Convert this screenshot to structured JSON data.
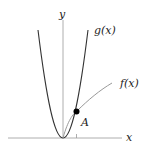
{
  "diagram": {
    "axes": {
      "x_label": "x",
      "y_label": "y"
    },
    "curves": [
      {
        "name": "g",
        "label": "g(x)",
        "description": "parabola through origin"
      },
      {
        "name": "f",
        "label": "f(x)",
        "description": "concave increasing curve from origin"
      }
    ],
    "point": {
      "label": "A",
      "description": "intersection of f(x) and g(x)"
    },
    "colors": {
      "axis": "#999999",
      "curve_g": "#333333",
      "curve_f": "#999999",
      "point": "#000000"
    }
  }
}
